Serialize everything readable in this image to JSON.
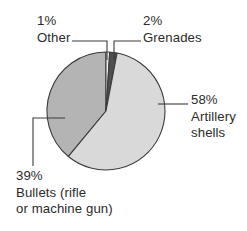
{
  "chart_data": {
    "type": "pie",
    "title": "",
    "subtitle": "",
    "xlabel": "",
    "ylabel": "",
    "grid": false,
    "legend_position": "callout-labels",
    "units": "percent",
    "total": 100,
    "start_angle_deg": 0,
    "direction": "clockwise",
    "categories": [
      "Artillery shells",
      "Bullets (rifle or machine gun)",
      "Other",
      "Grenades"
    ],
    "values": [
      58,
      39,
      1,
      2
    ],
    "slices": [
      {
        "label": "Artillery shells",
        "value": 58,
        "percent_text": "58%",
        "color": "#d9d9d9",
        "start_deg": 10.8,
        "end_deg": 219.6
      },
      {
        "label": "Bullets (rifle or machine gun)",
        "value": 39,
        "percent_text": "39%",
        "color": "#b4b4b4",
        "start_deg": 219.6,
        "end_deg": 360.0
      },
      {
        "label": "Other",
        "value": 1,
        "percent_text": "1%",
        "color": "#ededed",
        "start_deg": 0.0,
        "end_deg": 3.6
      },
      {
        "label": "Grenades",
        "value": 2,
        "percent_text": "2%",
        "color": "#4f4f4f",
        "start_deg": 3.6,
        "end_deg": 10.8
      }
    ]
  },
  "labels": {
    "other": {
      "percent": "1%",
      "name": "Other"
    },
    "grenades": {
      "percent": "2%",
      "name": "Grenades"
    },
    "artillery": {
      "percent": "58%",
      "name_line1": "Artillery",
      "name_line2": "shells"
    },
    "bullets": {
      "percent": "39%",
      "name_line1": "Bullets (rifle",
      "name_line2": "or machine gun)"
    }
  },
  "colors": {
    "artillery_fill": "#d9d9d9",
    "bullets_fill": "#b4b4b4",
    "grenades_fill": "#4f4f4f",
    "other_fill": "#ededed",
    "outline": "#3a3a3a",
    "leader_line": "#3a3a3a",
    "text": "#2b2b2b",
    "background": "#ffffff"
  }
}
